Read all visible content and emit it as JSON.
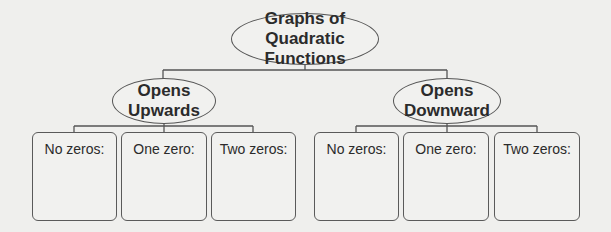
{
  "diagram": {
    "root": {
      "lines": [
        "Graphs of Quadratic",
        "Functions"
      ]
    },
    "branches": [
      {
        "lines": [
          "Opens",
          "Upwards"
        ],
        "leaves": [
          {
            "label": "No zeros:"
          },
          {
            "label": "One zero:"
          },
          {
            "label": "Two zeros:"
          }
        ]
      },
      {
        "lines": [
          "Opens",
          "Downward"
        ],
        "leaves": [
          {
            "label": "No zeros:"
          },
          {
            "label": "One zero:"
          },
          {
            "label": "Two zeros:"
          }
        ]
      }
    ]
  }
}
